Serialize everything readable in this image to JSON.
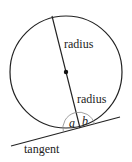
{
  "diagram": {
    "labels": {
      "radius_upper": "radius",
      "radius_lower": "radius",
      "tangent": "tangent",
      "angle_a": "a",
      "angle_b": "b"
    },
    "colors": {
      "stroke": "#222222",
      "arc": "#888888",
      "background": "#ffffff"
    }
  }
}
